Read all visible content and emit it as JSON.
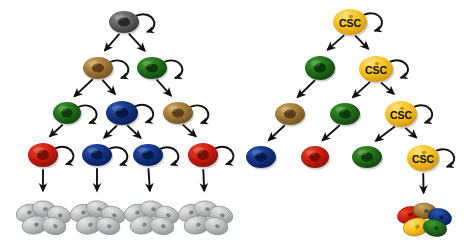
{
  "figure": {
    "title": "",
    "type": "cell-lineage-hierarchy-diagram",
    "background_color": "#ffffff",
    "panels": [
      {
        "id": "left-panel",
        "name": "stochastic-clonal-evolution-model",
        "caption": "",
        "terminal_cluster_type": "homogeneous-gray",
        "nodes": [
          {
            "id": "L-r1-c1",
            "row": 1,
            "label": "",
            "color_name": "gray",
            "fill": "#5b5b5b",
            "x": 124,
            "y": 22,
            "rx": 15,
            "ry": 11,
            "self_renew": true
          },
          {
            "id": "L-r2-c1",
            "row": 2,
            "label": "",
            "color_name": "brown",
            "fill": "#9a7434",
            "x": 98,
            "y": 68,
            "rx": 15,
            "ry": 11,
            "self_renew": true
          },
          {
            "id": "L-r2-c2",
            "row": 2,
            "label": "",
            "color_name": "green",
            "fill": "#1f6a1a",
            "x": 152,
            "y": 68,
            "rx": 15,
            "ry": 11,
            "self_renew": true
          },
          {
            "id": "L-r3-c1",
            "row": 3,
            "label": "",
            "color_name": "green",
            "fill": "#1f6a1a",
            "x": 67,
            "y": 113,
            "rx": 14,
            "ry": 11,
            "self_renew": true
          },
          {
            "id": "L-r3-c2",
            "row": 3,
            "label": "",
            "color_name": "blue",
            "fill": "#11317e",
            "x": 122,
            "y": 113,
            "rx": 16,
            "ry": 12,
            "self_renew": true
          },
          {
            "id": "L-r3-c3",
            "row": 3,
            "label": "",
            "color_name": "brown",
            "fill": "#9a7434",
            "x": 178,
            "y": 113,
            "rx": 15,
            "ry": 11,
            "self_renew": true
          },
          {
            "id": "L-r4-c1",
            "row": 4,
            "label": "",
            "color_name": "red",
            "fill": "#c21a0d",
            "x": 43,
            "y": 155,
            "rx": 15,
            "ry": 12,
            "self_renew": true
          },
          {
            "id": "L-r4-c2",
            "row": 4,
            "label": "",
            "color_name": "blue",
            "fill": "#11317e",
            "x": 97,
            "y": 155,
            "rx": 15,
            "ry": 11,
            "self_renew": true
          },
          {
            "id": "L-r4-c3",
            "row": 4,
            "label": "",
            "color_name": "blue",
            "fill": "#11317e",
            "x": 148,
            "y": 155,
            "rx": 15,
            "ry": 11,
            "self_renew": true
          },
          {
            "id": "L-r4-c4",
            "row": 4,
            "label": "",
            "color_name": "red",
            "fill": "#c21a0d",
            "x": 203,
            "y": 155,
            "rx": 15,
            "ry": 12,
            "self_renew": true
          }
        ],
        "clusters": [
          {
            "id": "L-cl-1",
            "x": 43,
            "y": 218,
            "color_name": "gray",
            "fill": "#b9bcbd"
          },
          {
            "id": "L-cl-2",
            "x": 97,
            "y": 218,
            "color_name": "gray",
            "fill": "#b9bcbd"
          },
          {
            "id": "L-cl-3",
            "x": 151,
            "y": 218,
            "color_name": "gray",
            "fill": "#b9bcbd"
          },
          {
            "id": "L-cl-4",
            "x": 205,
            "y": 218,
            "color_name": "gray",
            "fill": "#b9bcbd"
          }
        ],
        "edges": [
          {
            "from": "L-r1-c1",
            "to": "L-r2-c1"
          },
          {
            "from": "L-r1-c1",
            "to": "L-r2-c2"
          },
          {
            "from": "L-r2-c1",
            "to": "L-r3-c1"
          },
          {
            "from": "L-r2-c1",
            "to": "L-r3-c2"
          },
          {
            "from": "L-r2-c2",
            "to": "L-r3-c3"
          },
          {
            "from": "L-r3-c1",
            "to": "L-r4-c1"
          },
          {
            "from": "L-r3-c2",
            "to": "L-r4-c2"
          },
          {
            "from": "L-r3-c2",
            "to": "L-r4-c3"
          },
          {
            "from": "L-r3-c3",
            "to": "L-r4-c4"
          },
          {
            "from": "L-r4-c1",
            "to": "L-cl-1"
          },
          {
            "from": "L-r4-c2",
            "to": "L-cl-2"
          },
          {
            "from": "L-r4-c3",
            "to": "L-cl-3"
          },
          {
            "from": "L-r4-c4",
            "to": "L-cl-4"
          }
        ]
      },
      {
        "id": "right-panel",
        "name": "cancer-stem-cell-hierarchy-model",
        "caption": "",
        "terminal_cluster_type": "heterogeneous-multicolor",
        "stem_cell_label": "CSC",
        "nodes": [
          {
            "id": "R-r1-c1",
            "row": 1,
            "label": "CSC",
            "color_name": "yellow",
            "fill": "#f5c21e",
            "x": 350,
            "y": 22,
            "rx": 17,
            "ry": 13,
            "self_renew": true
          },
          {
            "id": "R-r2-c1",
            "row": 2,
            "label": "",
            "color_name": "green",
            "fill": "#1f6a1a",
            "x": 320,
            "y": 68,
            "rx": 15,
            "ry": 12,
            "self_renew": false
          },
          {
            "id": "R-r2-c2",
            "row": 2,
            "label": "CSC",
            "color_name": "yellow",
            "fill": "#f5c21e",
            "x": 376,
            "y": 69,
            "rx": 17,
            "ry": 13,
            "self_renew": true
          },
          {
            "id": "R-r3-c1",
            "row": 3,
            "label": "",
            "color_name": "brown",
            "fill": "#9a7434",
            "x": 290,
            "y": 114,
            "rx": 15,
            "ry": 11,
            "self_renew": false
          },
          {
            "id": "R-r3-c2",
            "row": 3,
            "label": "",
            "color_name": "green",
            "fill": "#1f6a1a",
            "x": 345,
            "y": 114,
            "rx": 15,
            "ry": 11,
            "self_renew": false
          },
          {
            "id": "R-r3-c3",
            "row": 3,
            "label": "CSC",
            "color_name": "yellow",
            "fill": "#f5c21e",
            "x": 401,
            "y": 114,
            "rx": 16,
            "ry": 13,
            "self_renew": true
          },
          {
            "id": "R-r4-c1",
            "row": 4,
            "label": "",
            "color_name": "blue",
            "fill": "#11317e",
            "x": 261,
            "y": 157,
            "rx": 15,
            "ry": 11,
            "self_renew": false
          },
          {
            "id": "R-r4-c2",
            "row": 4,
            "label": "",
            "color_name": "red",
            "fill": "#c21a0d",
            "x": 315,
            "y": 157,
            "rx": 14,
            "ry": 11,
            "self_renew": false
          },
          {
            "id": "R-r4-c3",
            "row": 4,
            "label": "",
            "color_name": "green",
            "fill": "#1f6a1a",
            "x": 367,
            "y": 157,
            "rx": 15,
            "ry": 11,
            "self_renew": false
          },
          {
            "id": "R-r4-c4",
            "row": 4,
            "label": "CSC",
            "color_name": "yellow",
            "fill": "#f5c21e",
            "x": 423,
            "y": 158,
            "rx": 16,
            "ry": 13,
            "self_renew": true
          }
        ],
        "clusters": [
          {
            "id": "R-cl-1",
            "x": 424,
            "y": 220,
            "color_name": "multicolor",
            "fill": "multi"
          }
        ],
        "edges": [
          {
            "from": "R-r1-c1",
            "to": "R-r2-c1"
          },
          {
            "from": "R-r1-c1",
            "to": "R-r2-c2"
          },
          {
            "from": "R-r2-c1",
            "to": "R-r3-c1"
          },
          {
            "from": "R-r2-c2",
            "to": "R-r3-c2"
          },
          {
            "from": "R-r2-c2",
            "to": "R-r3-c3"
          },
          {
            "from": "R-r3-c1",
            "to": "R-r4-c1"
          },
          {
            "from": "R-r3-c2",
            "to": "R-r4-c2"
          },
          {
            "from": "R-r3-c3",
            "to": "R-r4-c3"
          },
          {
            "from": "R-r3-c3",
            "to": "R-r4-c4"
          },
          {
            "from": "R-r4-c4",
            "to": "R-cl-1"
          }
        ]
      }
    ],
    "palette": {
      "gray_cell": "#5b5b5b",
      "brown_cell": "#9a7434",
      "green_cell": "#1f6a1a",
      "blue_cell": "#11317e",
      "red_cell": "#c21a0d",
      "yellow_csc_cell": "#f5c21e",
      "gray_cluster": "#b9bcbd",
      "arrow": "#111111",
      "label_text": "#1a1208"
    },
    "multicolor_cluster_cells": [
      {
        "color_name": "red",
        "fill": "#c21a0d"
      },
      {
        "color_name": "brown",
        "fill": "#8a6a2c"
      },
      {
        "color_name": "blue",
        "fill": "#11317e"
      },
      {
        "color_name": "yellow",
        "fill": "#f0b81a"
      },
      {
        "color_name": "green",
        "fill": "#2a7a1a"
      }
    ]
  }
}
